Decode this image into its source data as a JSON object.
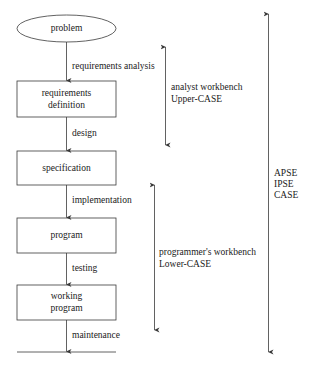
{
  "diagram": {
    "type": "software-lifecycle-flow",
    "colors": {
      "stroke": "#3a3a3a",
      "text": "#1a1a1a",
      "background": "#ffffff"
    },
    "nodes": [
      {
        "id": "problem",
        "shape": "ellipse",
        "label": "problem"
      },
      {
        "id": "requirements-definition",
        "shape": "rect",
        "label": "requirements\ndefinition"
      },
      {
        "id": "specification",
        "shape": "rect",
        "label": "specification"
      },
      {
        "id": "program",
        "shape": "rect",
        "label": "program"
      },
      {
        "id": "working-program",
        "shape": "rect",
        "label": "working\nprogram"
      }
    ],
    "edges": [
      {
        "from": "problem",
        "to": "requirements-definition",
        "label": "requirements analysis"
      },
      {
        "from": "requirements-definition",
        "to": "specification",
        "label": "design"
      },
      {
        "from": "specification",
        "to": "program",
        "label": "implementation"
      },
      {
        "from": "program",
        "to": "working-program",
        "label": "testing"
      },
      {
        "from": "working-program",
        "to": "baseline",
        "label": "maintenance"
      }
    ],
    "spans": [
      {
        "id": "analyst",
        "lines": [
          "analyst workbench",
          "Upper-CASE"
        ],
        "covers": "requirements analysis – design"
      },
      {
        "id": "programmer",
        "lines": [
          "programmer's workbench",
          "Lower-CASE"
        ],
        "covers": "implementation – maintenance"
      },
      {
        "id": "environment",
        "lines": [
          "APSE",
          "IPSE",
          "CASE"
        ],
        "covers": "entire lifecycle"
      }
    ]
  }
}
